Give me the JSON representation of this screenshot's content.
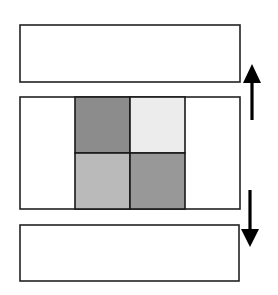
{
  "diagram": {
    "type": "stacked-panels-with-scroll-arrows",
    "panels": [
      {
        "id": "top",
        "x": 20,
        "y": 25,
        "w": 220,
        "h": 57,
        "fill": "#ffffff",
        "stroke": "#222222"
      },
      {
        "id": "middle",
        "x": 20,
        "y": 97,
        "w": 220,
        "h": 112,
        "fill": "#ffffff",
        "stroke": "#222222"
      },
      {
        "id": "bottom",
        "x": 20,
        "y": 225,
        "w": 219,
        "h": 56,
        "fill": "#ffffff",
        "stroke": "#222222"
      }
    ],
    "grid": {
      "x": 75,
      "y": 97,
      "cell_w": 55,
      "cell_h": 56,
      "stroke": "#1a1a1a",
      "cells": [
        {
          "row": 0,
          "col": 0,
          "fill": "#8c8c8c"
        },
        {
          "row": 0,
          "col": 1,
          "fill": "#ececec"
        },
        {
          "row": 1,
          "col": 0,
          "fill": "#bababa"
        },
        {
          "row": 1,
          "col": 1,
          "fill": "#989898"
        }
      ]
    },
    "arrows": [
      {
        "id": "up",
        "direction": "up",
        "shaft_x": 252,
        "shaft_y1": 120,
        "shaft_y2": 80,
        "head": "252,64 243,83 261,83",
        "color": "#000000"
      },
      {
        "id": "down",
        "direction": "down",
        "shaft_x": 250,
        "shaft_y1": 190,
        "shaft_y2": 232,
        "head": "250,247 241,229 259,229",
        "color": "#000000"
      }
    ]
  }
}
